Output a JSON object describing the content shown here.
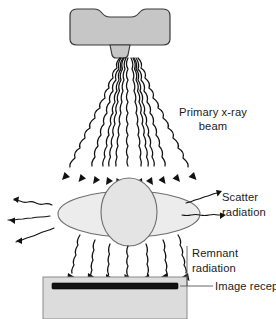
{
  "figure": {
    "background_color": "#ffffff",
    "width": 276,
    "height": 319
  },
  "labels": {
    "primary_beam_line1": "Primary x-ray",
    "primary_beam_line2": "beam",
    "scatter_line1": "Scatter",
    "scatter_line2": "radiation",
    "remnant_line1": "Remnant",
    "remnant_line2": "radiation",
    "image_receptor": "Image receptor"
  },
  "components": {
    "tube_housing": "x-ray-tube-housing",
    "tube_neck": "tube-collimator-neck",
    "anatomy_body": "patient-body-cross-section",
    "anatomy_organ": "patient-organ",
    "table": "radiographic-table",
    "receptor": "image-receptor-bar"
  },
  "colors": {
    "tube_fill": "#c6c6c6",
    "tube_stroke": "#3a3a3a",
    "anatomy_fill": "#ececec",
    "organ_fill": "#e4e4e4",
    "anatomy_stroke": "#6e6e6e",
    "table_fill": "#dcdcdc",
    "table_stroke": "#8a8a8a",
    "receptor_fill": "#111111",
    "ray_stroke": "#111111",
    "text_color": "#1a1a1a",
    "leader_stroke": "#555555"
  },
  "rays": {
    "primary_beam_count": 11,
    "scatter_left_count": 3,
    "scatter_right_count": 2,
    "remnant_count": 7,
    "style": "wavy-sinusoidal-with-arrowhead"
  }
}
